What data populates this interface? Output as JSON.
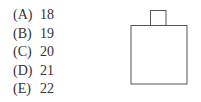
{
  "question": {
    "choices": [
      {
        "label": "(A)",
        "value": "18"
      },
      {
        "label": "(B)",
        "value": "19"
      },
      {
        "label": "(C)",
        "value": "20"
      },
      {
        "label": "(D)",
        "value": "21"
      },
      {
        "label": "(E)",
        "value": "22"
      }
    ]
  },
  "figure": {
    "stroke_color": "#555555"
  }
}
